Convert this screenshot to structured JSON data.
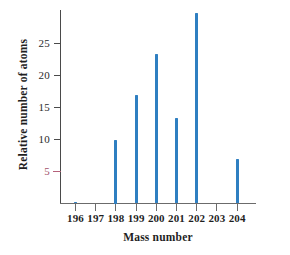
{
  "chart_data": {
    "type": "bar",
    "title": "",
    "subtitle": "",
    "xlabel": "Mass number",
    "ylabel": "Relative number of atoms",
    "categories": [
      "196",
      "197",
      "198",
      "199",
      "200",
      "201",
      "202",
      "203",
      "204"
    ],
    "values": [
      0.2,
      0,
      10.0,
      17.0,
      23.3,
      13.4,
      29.7,
      0,
      6.9
    ],
    "series": [
      {
        "name": "Relative number of atoms",
        "values": [
          0.2,
          0,
          10.0,
          17.0,
          23.3,
          13.4,
          29.7,
          0,
          6.9
        ]
      }
    ],
    "xlim": [
      195.3,
      204.8
    ],
    "ylim": [
      0,
      30.3
    ],
    "yticks": [
      5,
      10,
      15,
      20,
      25
    ],
    "ytick_labels": [
      "5",
      "10",
      "15",
      "20",
      "25"
    ],
    "xticks": [
      196,
      197,
      198,
      199,
      200,
      201,
      202,
      203,
      204
    ],
    "xtick_labels": [
      "196",
      "197",
      "198",
      "199",
      "200",
      "201",
      "202",
      "203",
      "204"
    ],
    "grid": false,
    "legend": false,
    "legend_position": "none",
    "bar_color": "#2f7fc1",
    "axis_color": "#4a4a4a",
    "accent_color": "#b5617a",
    "annotations": []
  },
  "axes": {
    "x_title": "Mass number",
    "y_title": "Relative number of atoms"
  }
}
